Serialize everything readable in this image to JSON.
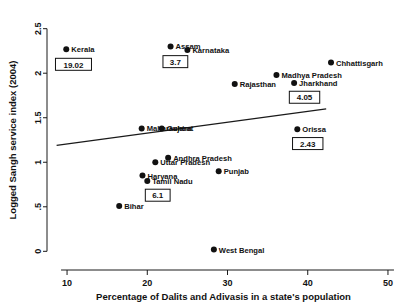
{
  "chart_data": {
    "type": "scatter",
    "title": "",
    "xlabel": "Percentage of Dalits and Adivasis in a state's population",
    "ylabel": "Logged Sangh service index (2004)",
    "xlim": [
      7.5,
      51.5
    ],
    "ylim": [
      -0.12,
      2.62
    ],
    "xticks": [
      10,
      20,
      30,
      40,
      50
    ],
    "xtick_labels": [
      "10",
      "20",
      "30",
      "40",
      "50"
    ],
    "yticks": [
      0,
      0.5,
      1,
      1.5,
      2,
      2.5
    ],
    "ytick_labels": [
      "0",
      ".5",
      "1",
      "1.5",
      "2",
      "2.5"
    ],
    "grid": false,
    "legend": "none",
    "points": [
      {
        "label": "Kerala",
        "x": 9.9,
        "y": 2.27,
        "label_dx": 5,
        "label_dy": 3
      },
      {
        "label": "Assam",
        "x": 22.9,
        "y": 2.3,
        "label_dx": 5,
        "label_dy": 3
      },
      {
        "label": "Karnataka",
        "x": 25.0,
        "y": 2.26,
        "label_dx": 5,
        "label_dy": 3
      },
      {
        "label": "Chhattisgarh",
        "x": 42.9,
        "y": 2.12,
        "label_dx": 5,
        "label_dy": 3
      },
      {
        "label": "Madhya Pradesh",
        "x": 36.1,
        "y": 1.98,
        "label_dx": 5,
        "label_dy": 3
      },
      {
        "label": "Jharkhand",
        "x": 38.3,
        "y": 1.89,
        "label_dx": 5,
        "label_dy": 3
      },
      {
        "label": "Rajasthan",
        "x": 30.9,
        "y": 1.88,
        "label_dx": 5,
        "label_dy": 3
      },
      {
        "label": "Orissa",
        "x": 38.7,
        "y": 1.37,
        "label_dx": 5,
        "label_dy": 3
      },
      {
        "label": "Maharashtra",
        "x": 19.3,
        "y": 1.38,
        "label_dx": 5,
        "label_dy": 3
      },
      {
        "label": "Gujarat",
        "x": 21.8,
        "y": 1.38,
        "label_dx": 5,
        "label_dy": 3
      },
      {
        "label": "Andhra Pradesh",
        "x": 22.6,
        "y": 1.05,
        "label_dx": 5,
        "label_dy": 3
      },
      {
        "label": "Uttar Pradesh",
        "x": 21.0,
        "y": 1.0,
        "label_dx": 5,
        "label_dy": 3
      },
      {
        "label": "Punjab",
        "x": 28.9,
        "y": 0.9,
        "label_dx": 5,
        "label_dy": 3
      },
      {
        "label": "Haryana",
        "x": 19.4,
        "y": 0.85,
        "label_dx": 5,
        "label_dy": 3
      },
      {
        "label": "Tamil Nadu",
        "x": 20.0,
        "y": 0.79,
        "label_dx": 5,
        "label_dy": 3
      },
      {
        "label": "Bihar",
        "x": 16.5,
        "y": 0.51,
        "label_dx": 5,
        "label_dy": 3
      },
      {
        "label": "West Bengal",
        "x": 28.3,
        "y": 0.02,
        "label_dx": 5,
        "label_dy": 3
      }
    ],
    "callouts": [
      {
        "value": "19.02",
        "for": "Kerala",
        "x": 10.8,
        "y": 2.1
      },
      {
        "value": "3.7",
        "for": "Assam",
        "x": 23.5,
        "y": 2.13
      },
      {
        "value": "4.05",
        "for": "Jharkhand",
        "x": 39.6,
        "y": 1.73
      },
      {
        "value": "2.43",
        "for": "Orissa",
        "x": 40.0,
        "y": 1.21
      },
      {
        "value": "6.1",
        "for": "Tamil Nadu",
        "x": 21.3,
        "y": 0.63
      }
    ],
    "fit_line": {
      "name": "linear-fit",
      "x_start": 8.7,
      "y_start": 1.19,
      "x_end": 42.3,
      "y_end": 1.6
    }
  }
}
